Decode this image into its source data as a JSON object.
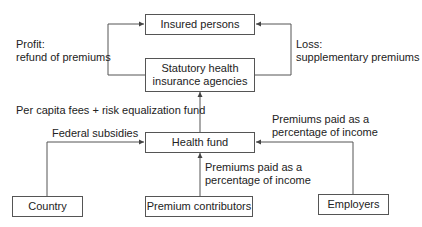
{
  "diagram": {
    "nodes": {
      "insured_persons": "Insured persons",
      "agencies_line1": "Statutory health",
      "agencies_line2": "insurance agencies",
      "health_fund": "Health fund",
      "country": "Country",
      "premium_contributors": "Premium contributors",
      "employers": "Employers"
    },
    "edge_labels": {
      "profit_line1": "Profit:",
      "profit_line2": "refund of premiums",
      "loss_line1": "Loss:",
      "loss_line2": "supplementary premiums",
      "per_capita": "Per capita fees + risk equalization fund",
      "federal_subsidies": "Federal subsidies",
      "contributors_line1": "Premiums paid as a",
      "contributors_line2": "percentage of income",
      "employers_line1": "Premiums paid as a",
      "employers_line2": "percentage of income"
    },
    "colors": {
      "line": "#555555",
      "text": "#222222",
      "background": "#ffffff"
    }
  }
}
